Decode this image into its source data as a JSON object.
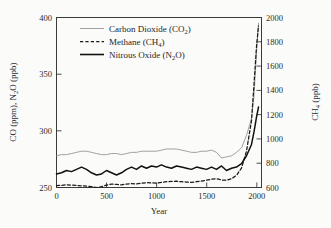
{
  "figure": {
    "background_color": "#fbfbfa",
    "frame_color": "#3a3a3a"
  },
  "axes": {
    "left": {
      "title": "CO (ppm), N",
      "title_sub": "2",
      "title_tail": "O (ppb)",
      "ticks": [
        "250",
        "300",
        "350",
        "400"
      ],
      "min": 250,
      "max": 400
    },
    "right": {
      "title": "CH",
      "title_sub": "4",
      "title_tail": " (ppb)",
      "ticks": [
        "600",
        "800",
        "1000",
        "1200",
        "1400",
        "1600",
        "1800",
        "2000"
      ],
      "min": 600,
      "max": 2000
    },
    "bottom": {
      "title": "Year",
      "ticks": [
        "0",
        "500",
        "1000",
        "1500",
        "2000"
      ],
      "min": 0,
      "max": 2050
    }
  },
  "legend": {
    "entries": [
      {
        "label": "Carbon Dioxide (CO",
        "sub": "2",
        "tail": ")",
        "style": "thin-solid",
        "color": "#8a8a8a"
      },
      {
        "label": "Methane (CH",
        "sub": "4",
        "tail": ")",
        "style": "dashed",
        "color": "#1a1a1a"
      },
      {
        "label": "Nitrous Oxide (N",
        "sub": "2",
        "tail": "O)",
        "style": "thick-solid",
        "color": "#111111"
      }
    ]
  },
  "chart_data": {
    "type": "line",
    "title": "",
    "xlabel": "Year",
    "ylabel": "CO (ppm), N2O (ppb)",
    "ylabel_right": "CH4 (ppb)",
    "xlim": [
      0,
      2050
    ],
    "ylim": [
      250,
      400
    ],
    "ylim_right": [
      600,
      2000
    ],
    "grid": false,
    "legend_position": "top-center",
    "x": [
      0,
      50,
      100,
      150,
      200,
      250,
      300,
      350,
      400,
      450,
      500,
      550,
      600,
      650,
      700,
      750,
      800,
      850,
      900,
      950,
      1000,
      1050,
      1100,
      1150,
      1200,
      1250,
      1300,
      1350,
      1400,
      1450,
      1500,
      1550,
      1600,
      1650,
      1700,
      1750,
      1800,
      1850,
      1900,
      1950,
      1975,
      2000,
      2020
    ],
    "series": [
      {
        "name": "Carbon Dioxide (CO2)",
        "unit": "ppm",
        "axis": "left",
        "style": "thin-solid",
        "values": [
          278,
          279,
          279,
          280,
          281,
          282,
          282,
          281,
          280,
          279,
          279,
          280,
          280,
          279,
          280,
          281,
          281,
          282,
          282,
          282,
          282,
          283,
          284,
          284,
          284,
          283,
          282,
          281,
          281,
          282,
          282,
          283,
          281,
          276,
          277,
          278,
          281,
          285,
          296,
          311,
          331,
          369,
          395
        ]
      },
      {
        "name": "Methane (CH4)",
        "unit": "ppb",
        "axis": "right",
        "style": "dashed",
        "values": [
          615,
          618,
          622,
          620,
          616,
          614,
          612,
          608,
          600,
          607,
          620,
          628,
          625,
          622,
          628,
          632,
          630,
          636,
          640,
          638,
          636,
          642,
          648,
          650,
          652,
          648,
          645,
          642,
          648,
          652,
          660,
          668,
          672,
          662,
          660,
          672,
          700,
          760,
          900,
          1150,
          1450,
          1760,
          1930
        ]
      },
      {
        "name": "Nitrous Oxide (N2O)",
        "unit": "ppb",
        "axis": "left",
        "style": "thick-solid",
        "values": [
          262,
          263,
          265,
          264,
          266,
          268,
          266,
          263,
          261,
          262,
          265,
          263,
          261,
          263,
          266,
          268,
          266,
          269,
          267,
          269,
          268,
          270,
          268,
          267,
          269,
          268,
          267,
          266,
          268,
          267,
          266,
          268,
          266,
          269,
          265,
          267,
          268,
          271,
          278,
          288,
          299,
          312,
          321
        ]
      }
    ]
  }
}
